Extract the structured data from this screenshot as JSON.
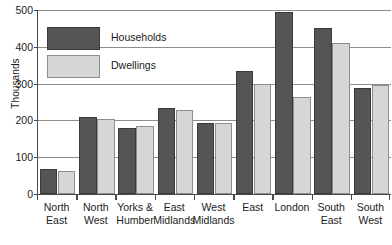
{
  "chart_data": {
    "type": "bar",
    "title": "",
    "xlabel": "",
    "ylabel": "Thousands",
    "ylim": [
      0,
      500
    ],
    "yticks": [
      0,
      100,
      200,
      300,
      400,
      500
    ],
    "grid": true,
    "legend_position": "inside-top-left",
    "categories": [
      "North East",
      "North West",
      "Yorks & Humber",
      "East Midlands",
      "West Midlands",
      "East",
      "London",
      "South East",
      "South West"
    ],
    "category_lines": [
      [
        "North",
        "East"
      ],
      [
        "North",
        "West"
      ],
      [
        "Yorks &",
        "Humber"
      ],
      [
        "East",
        "Midlands"
      ],
      [
        "West",
        "Midlands"
      ],
      [
        "East",
        ""
      ],
      [
        "London",
        ""
      ],
      [
        "South",
        "East"
      ],
      [
        "South",
        "West"
      ]
    ],
    "series": [
      {
        "name": "Households",
        "color": "#555555",
        "values": [
          68,
          208,
          180,
          233,
          192,
          333,
          495,
          450,
          287
        ]
      },
      {
        "name": "Dwellings",
        "color": "#d6d6d6",
        "values": [
          62,
          203,
          186,
          228,
          192,
          300,
          263,
          410,
          297
        ]
      }
    ]
  },
  "axis": {
    "y_title": "Thousands",
    "y_tick_labels": [
      "500",
      "400",
      "300",
      "200",
      "100",
      "0"
    ]
  },
  "legend": {
    "items": [
      {
        "label": "Households",
        "swatch": "households"
      },
      {
        "label": "Dwellings",
        "swatch": "dwellings"
      }
    ]
  }
}
